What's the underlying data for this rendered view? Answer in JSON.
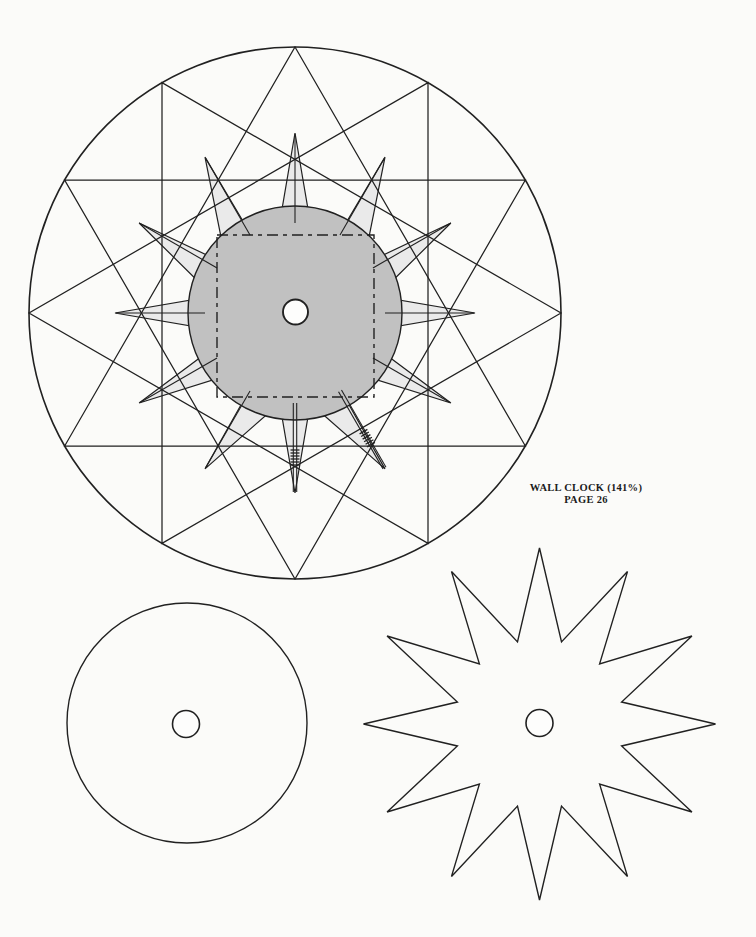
{
  "page": {
    "background": "#fbfbf9",
    "ink": "#212121",
    "width": 756,
    "height": 937
  },
  "label": {
    "line1": "WALL CLOCK (141%)",
    "line2": "PAGE 26"
  },
  "diagram": {
    "assembly": {
      "piece": "wall-clock-assembly",
      "center": [
        295,
        313
      ],
      "outer_radius": 266,
      "triangle_angles": [
        0,
        30,
        60,
        90
      ],
      "face_radius": 107,
      "face_fill": "#c1c1c1",
      "spike_fill": "#eaeaea",
      "spike_count": 12,
      "spike_tip_radius": 180,
      "spike_length": 88,
      "spike_half_width": 15,
      "spike_tilts": [
        0,
        -9,
        -5,
        0,
        -3,
        -9,
        0,
        9,
        3,
        0,
        5,
        9
      ],
      "tick_inner_radius": 90,
      "tick_outer_radius": 179,
      "double_tick_hours": [
        5,
        6
      ],
      "double_tick_gap": 1.7,
      "hatch_radii": [
        137,
        140,
        143,
        146,
        149,
        152
      ],
      "hatch_half_len": 4.5,
      "square": {
        "x": 217,
        "y": 235,
        "w": 157,
        "h": 162,
        "dash": "11 5 4 5"
      },
      "hole_center": [
        295.5,
        312
      ],
      "hole_radius": 12.5
    },
    "disc": {
      "piece": "clock-face-disc",
      "center": [
        187,
        723
      ],
      "radius": 120,
      "hole_center": [
        186,
        724
      ],
      "hole_radius": 13.5
    },
    "starburst": {
      "piece": "star-burst",
      "center": [
        539.5,
        724
      ],
      "points": 12,
      "outer_radius": 176,
      "inner_radius": 85,
      "hole_center": [
        539.5,
        723
      ],
      "hole_radius": 13.5
    }
  }
}
